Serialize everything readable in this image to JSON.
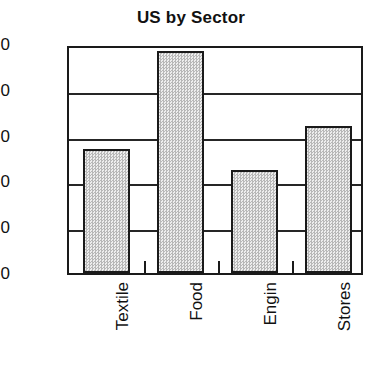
{
  "chart_data": {
    "type": "bar",
    "title": "US by Sector",
    "xlabel": "",
    "ylabel": "",
    "categories": [
      "Textile",
      "Food",
      "Engin",
      "Stores"
    ],
    "values": [
      5.4,
      9.7,
      4.5,
      6.4
    ],
    "ylim": [
      0.0,
      10.0
    ],
    "ytick_labels": [
      "10.0",
      "8.0",
      "6.0",
      "4.0",
      "2.0",
      "0.0"
    ],
    "ytick_values": [
      10.0,
      8.0,
      6.0,
      4.0,
      2.0,
      0.0
    ],
    "grid": true,
    "legend": null,
    "legend_position": "none",
    "bar_fill_color": "#d2d2d2",
    "bar_edge_color": "#1a1a1a",
    "axis_color": "#1a1a1a",
    "text_color": "#111111",
    "background_color": "#ffffff",
    "xtick_marks_between_bars": true
  }
}
